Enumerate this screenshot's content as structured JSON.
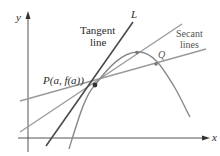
{
  "diagram": {
    "axes": {
      "x_label": "x",
      "y_label": "y"
    },
    "labels": {
      "tangent_line_1": "Tangent",
      "tangent_line_2": "line",
      "tangent_name": "L",
      "secant_1": "Secant",
      "secant_2": "lines",
      "point_p": "P(a, f(a))",
      "point_q": "Q"
    },
    "colors": {
      "axis": "#555555",
      "tangent": "#4a4a4a",
      "secant": "#9a9a9a",
      "curve": "#8a8a8a",
      "point": "#333333"
    }
  }
}
